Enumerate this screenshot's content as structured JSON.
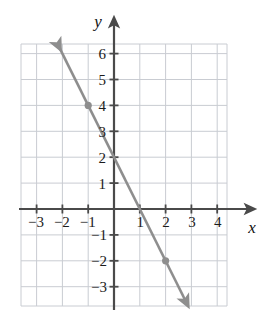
{
  "figure": {
    "kind": "coordinate-plane-line-graph",
    "background_color": "#ffffff",
    "grid_color": "#c9ccd2",
    "axis_color": "#4a4a4a",
    "line_color": "#8e8e8e",
    "point_color": "#8e8e8e",
    "label_color": "#1b1b1b"
  },
  "axes": {
    "x_label": "x",
    "y_label": "y",
    "x_ticks": [
      {
        "value": -3,
        "label": "−3"
      },
      {
        "value": -2,
        "label": "−2"
      },
      {
        "value": -1,
        "label": "−1"
      },
      {
        "value": 1,
        "label": "1"
      },
      {
        "value": 2,
        "label": "2"
      },
      {
        "value": 3,
        "label": "3"
      },
      {
        "value": 4,
        "label": "4"
      }
    ],
    "y_ticks": [
      {
        "value": 6,
        "label": "6"
      },
      {
        "value": 5,
        "label": "5"
      },
      {
        "value": 4,
        "label": "4"
      },
      {
        "value": 3,
        "label": "3"
      },
      {
        "value": 2,
        "label": "2"
      },
      {
        "value": 1,
        "label": "1"
      },
      {
        "value": -1,
        "label": "−1"
      },
      {
        "value": -2,
        "label": "−2"
      },
      {
        "value": -3,
        "label": "−3"
      }
    ]
  },
  "chart_data": {
    "type": "line",
    "title": "",
    "xlabel": "x",
    "ylabel": "y",
    "xlim": [
      -3.6,
      4.4
    ],
    "ylim": [
      -3.6,
      6.5
    ],
    "grid": true,
    "legend": false,
    "series": [
      {
        "name": "line",
        "slope": -2,
        "intercept": 2,
        "equation": "y = -2x + 2",
        "arrow_start": true,
        "arrow_end": true,
        "x": [
          -2.15,
          2.8
        ],
        "y": [
          6.3,
          -3.6
        ],
        "marked_points": [
          {
            "x": -1,
            "y": 4
          },
          {
            "x": 2,
            "y": -2
          }
        ]
      }
    ],
    "categories": [],
    "values": []
  }
}
